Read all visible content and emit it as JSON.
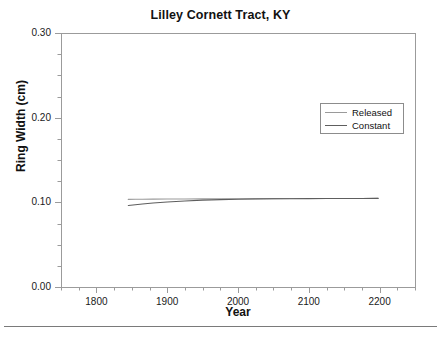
{
  "figure": {
    "width": 441,
    "height": 337,
    "background": "#ffffff",
    "bottom_rule_color": "#7a7a7a"
  },
  "chart_data": {
    "type": "line",
    "title": "Lilley Cornett Tract, KY",
    "xlabel": "Year",
    "ylabel": "Ring Width (cm)",
    "xlim": [
      1750,
      2250
    ],
    "ylim": [
      0.0,
      0.3
    ],
    "xticks": [
      1800,
      1900,
      2000,
      2100,
      2200
    ],
    "xtick_labels": [
      "1800",
      "1900",
      "2000",
      "2100",
      "2200"
    ],
    "xtick_minor_step": 25,
    "yticks": [
      0.0,
      0.1,
      0.2,
      0.3
    ],
    "ytick_labels": [
      "0.00",
      "0.10",
      "0.20",
      "0.30"
    ],
    "ytick_minor_step": 0.025,
    "grid": false,
    "legend_position": "upper right",
    "series": [
      {
        "name": "Released",
        "color": "#9a9a9a",
        "x": [
          1845,
          1855,
          1865,
          1880,
          1900,
          1925,
          1950,
          1975,
          2000,
          2025,
          2050,
          2075,
          2100,
          2125,
          2150,
          2175,
          2198
        ],
        "y": [
          0.1035,
          0.1036,
          0.1037,
          0.1038,
          0.1039,
          0.104,
          0.1041,
          0.1042,
          0.1043,
          0.1044,
          0.1044,
          0.1045,
          0.1045,
          0.1046,
          0.1046,
          0.1046,
          0.1047
        ]
      },
      {
        "name": "Constant",
        "color": "#5e5e5e",
        "x": [
          1845,
          1855,
          1865,
          1880,
          1900,
          1925,
          1950,
          1975,
          2000,
          2025,
          2050,
          2075,
          2100,
          2125,
          2150,
          2175,
          2198
        ],
        "y": [
          0.0962,
          0.0972,
          0.0981,
          0.0992,
          0.1004,
          0.1016,
          0.1026,
          0.1032,
          0.1037,
          0.104,
          0.1042,
          0.1043,
          0.1044,
          0.1045,
          0.1046,
          0.1046,
          0.1047
        ]
      }
    ]
  },
  "legend": {
    "entries": [
      {
        "label": "Released",
        "color": "#9a9a9a"
      },
      {
        "label": "Constant",
        "color": "#5e5e5e"
      }
    ]
  },
  "axes": {
    "frame_color": "#9b9b9b",
    "tick_color": "#9b9b9b"
  }
}
